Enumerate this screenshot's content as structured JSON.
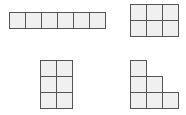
{
  "diagram": {
    "colors": {
      "fill": "#f0f0f0",
      "stroke": "#555555",
      "background": "#ffffff"
    },
    "cell_size": 16,
    "shapes": [
      {
        "id": "strip-1x6",
        "label": "1 by 6 row",
        "origin": [
          9,
          12
        ],
        "cells": [
          [
            0,
            0
          ],
          [
            1,
            0
          ],
          [
            2,
            0
          ],
          [
            3,
            0
          ],
          [
            4,
            0
          ],
          [
            5,
            0
          ]
        ]
      },
      {
        "id": "rect-3x2",
        "label": "3 by 2 rectangle",
        "origin": [
          130,
          4
        ],
        "cells": [
          [
            0,
            0
          ],
          [
            1,
            0
          ],
          [
            2,
            0
          ],
          [
            0,
            1
          ],
          [
            1,
            1
          ],
          [
            2,
            1
          ]
        ]
      },
      {
        "id": "rect-2x3",
        "label": "2 by 3 rectangle",
        "origin": [
          40,
          60
        ],
        "cells": [
          [
            0,
            0
          ],
          [
            1,
            0
          ],
          [
            0,
            1
          ],
          [
            1,
            1
          ],
          [
            0,
            2
          ],
          [
            1,
            2
          ]
        ]
      },
      {
        "id": "staircase",
        "label": "staircase 3-2-1",
        "origin": [
          130,
          60
        ],
        "cells": [
          [
            0,
            0
          ],
          [
            0,
            1
          ],
          [
            1,
            1
          ],
          [
            0,
            2
          ],
          [
            1,
            2
          ],
          [
            2,
            2
          ]
        ]
      }
    ]
  }
}
